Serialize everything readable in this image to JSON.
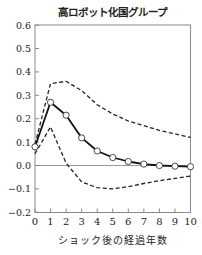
{
  "chart_data": {
    "type": "line",
    "title": "高ロボット化国グループ",
    "xlabel": "ショック後の経過年数",
    "ylabel": "",
    "x": [
      0,
      1,
      2,
      3,
      4,
      5,
      6,
      7,
      8,
      9,
      10
    ],
    "xlim": [
      0,
      10
    ],
    "ylim": [
      -0.2,
      0.6
    ],
    "xticks": [
      "0",
      "1",
      "2",
      "3",
      "4",
      "5",
      "6",
      "7",
      "8",
      "9",
      "10"
    ],
    "yticks": [
      "0.6",
      "0.5",
      "0.4",
      "0.3",
      "0.2",
      "0.1",
      "0.0",
      "−0.1",
      "−0.2"
    ],
    "ytick_values": [
      0.6,
      0.5,
      0.4,
      0.3,
      0.2,
      0.1,
      0.0,
      -0.1,
      -0.2
    ],
    "grid": false,
    "zero_line": true,
    "series": [
      {
        "name": "point_estimate",
        "style": "solid-with-circles",
        "color": "#111111",
        "values": [
          0.08,
          0.27,
          0.215,
          0.118,
          0.062,
          0.034,
          0.017,
          0.006,
          0.0,
          -0.003,
          -0.005
        ]
      },
      {
        "name": "upper_band",
        "style": "dashed",
        "color": "#222222",
        "values": [
          0.09,
          0.35,
          0.36,
          0.32,
          0.26,
          0.22,
          0.19,
          0.17,
          0.15,
          0.135,
          0.12
        ]
      },
      {
        "name": "lower_band",
        "style": "dashed",
        "color": "#222222",
        "values": [
          0.05,
          0.165,
          0.01,
          -0.07,
          -0.095,
          -0.1,
          -0.09,
          -0.077,
          -0.065,
          -0.055,
          -0.045
        ]
      }
    ]
  }
}
